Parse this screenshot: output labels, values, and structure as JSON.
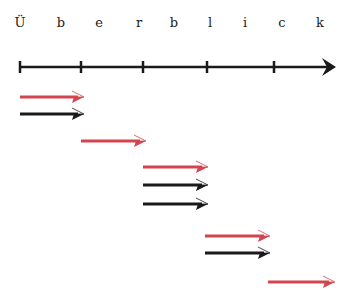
{
  "title": {
    "text": "Überblick",
    "letters": [
      "Ü",
      "b",
      "e",
      "r",
      "b",
      "l",
      "i",
      "c",
      "k"
    ],
    "letter_x": [
      20,
      61,
      99,
      139,
      174,
      210,
      245,
      282,
      320
    ]
  },
  "timeline": {
    "y": 67,
    "start_x": 20,
    "end_x": 336,
    "ticks_x": [
      20,
      81,
      143,
      207,
      274
    ],
    "color": "#1a1a1a"
  },
  "colors": {
    "red": "#d2454f",
    "black": "#1a1a1a"
  },
  "arrows": [
    {
      "y": 97,
      "x1": 20,
      "x2": 84,
      "color": "red"
    },
    {
      "y": 114,
      "x1": 20,
      "x2": 84,
      "color": "black"
    },
    {
      "y": 141,
      "x1": 81,
      "x2": 146,
      "color": "red"
    },
    {
      "y": 167,
      "x1": 143,
      "x2": 208,
      "color": "red"
    },
    {
      "y": 185,
      "x1": 143,
      "x2": 208,
      "color": "black"
    },
    {
      "y": 204,
      "x1": 143,
      "x2": 208,
      "color": "black"
    },
    {
      "y": 236,
      "x1": 205,
      "x2": 270,
      "color": "red"
    },
    {
      "y": 253,
      "x1": 205,
      "x2": 270,
      "color": "black"
    },
    {
      "y": 282,
      "x1": 268,
      "x2": 335,
      "color": "red"
    }
  ]
}
